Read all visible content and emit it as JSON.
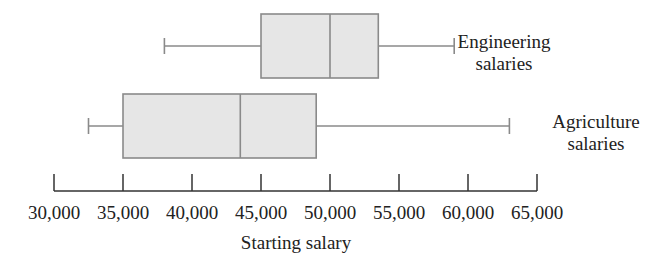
{
  "chart_data": {
    "type": "boxplot",
    "title": "",
    "xlabel": "Starting salary",
    "ylabel": "",
    "orientation": "horizontal",
    "grid": false,
    "legend": "none (series labeled directly to the right of each box)",
    "xlim": [
      30000,
      65000
    ],
    "x_ticks": [
      30000,
      35000,
      40000,
      45000,
      50000,
      55000,
      60000,
      65000
    ],
    "x_tick_labels": [
      "30,000",
      "35,000",
      "40,000",
      "45,000",
      "50,000",
      "55,000",
      "60,000",
      "65,000"
    ],
    "series": [
      {
        "name": "Engineering salaries",
        "label_lines": [
          "Engineering",
          "salaries"
        ],
        "min": 38000,
        "q1": 45000,
        "median": 50000,
        "q3": 53500,
        "max": 59000
      },
      {
        "name": "Agriculture salaries",
        "label_lines": [
          "Agriculture",
          "salaries"
        ],
        "min": 32500,
        "q1": 35000,
        "median": 43500,
        "q3": 49000,
        "max": 63000
      }
    ],
    "colors": {
      "box_fill": "#e6e6e6",
      "box_stroke": "#8a8a8a",
      "axis": "#333333",
      "text": "#222222"
    }
  }
}
